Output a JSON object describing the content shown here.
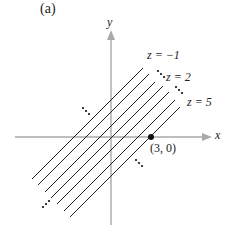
{
  "panel_label": "(a)",
  "axes": {
    "x_label": "x",
    "y_label": "y"
  },
  "level_curves": [
    {
      "label": "z = −1"
    },
    {
      "label": "z = 2"
    },
    {
      "label": "z = 5"
    }
  ],
  "point": {
    "label": "(3, 0)"
  },
  "ellipsis": "⋯",
  "colors": {
    "axis": "#a9a9a9",
    "line": "#222222",
    "text": "#222222"
  }
}
